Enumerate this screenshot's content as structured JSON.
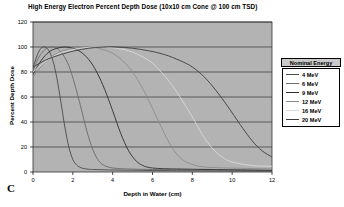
{
  "chart_data": {
    "type": "line",
    "title": "High Energy Electron Percent Depth Dose (10x10 cm Cone @ 100 cm TSD)",
    "xlabel": "Depth in Water (cm)",
    "ylabel": "Percent Depth Dose",
    "xlim": [
      0,
      12
    ],
    "ylim": [
      0,
      120
    ],
    "xticks": [
      0,
      2,
      4,
      6,
      8,
      10,
      12
    ],
    "yticks": [
      0,
      20,
      40,
      60,
      80,
      100,
      120
    ],
    "grid": "horizontal",
    "plot_background": "#b3b3b3",
    "legend_position": "right-outside",
    "legend_title": "Nominal Energy",
    "panel_letter": "C",
    "series": [
      {
        "name": "4 MeV",
        "color": "#4a4a4a",
        "x": [
          0,
          0.2,
          0.4,
          0.6,
          0.8,
          1.0,
          1.2,
          1.4,
          1.6,
          1.8,
          2.0,
          2.2,
          2.4,
          2.6,
          2.8,
          3.0,
          3.5,
          4.0,
          5.0,
          6.0,
          8.0,
          10.0,
          12.0
        ],
        "y": [
          83,
          93,
          99,
          100,
          97,
          89,
          75,
          56,
          36,
          20,
          10,
          5.5,
          3.5,
          2.6,
          2.2,
          2.0,
          1.8,
          1.6,
          1.4,
          1.2,
          1.0,
          0.8,
          0.6
        ]
      },
      {
        "name": "6 MeV",
        "color": "#6b6b6b",
        "x": [
          0,
          0.3,
          0.6,
          0.9,
          1.2,
          1.5,
          1.8,
          2.1,
          2.4,
          2.7,
          3.0,
          3.3,
          3.6,
          4.0,
          4.5,
          5.0,
          6.0,
          7.0,
          8.0,
          10.0,
          12.0
        ],
        "y": [
          81,
          92,
          98,
          100,
          99,
          94,
          85,
          70,
          52,
          33,
          18,
          9,
          5,
          3.2,
          2.6,
          2.3,
          2.0,
          1.8,
          1.6,
          1.3,
          1.0
        ]
      },
      {
        "name": "9 MeV",
        "color": "#2e2e2e",
        "x": [
          0,
          0.4,
          0.8,
          1.2,
          1.6,
          2.0,
          2.4,
          2.8,
          3.2,
          3.6,
          4.0,
          4.4,
          4.8,
          5.2,
          5.6,
          6.0,
          6.5,
          7.0,
          8.0,
          9.0,
          10.0,
          12.0
        ],
        "y": [
          78,
          89,
          96,
          99,
          100,
          99,
          96,
          90,
          80,
          66,
          49,
          31,
          17,
          8.5,
          4.6,
          3.2,
          2.7,
          2.5,
          2.2,
          2.0,
          1.8,
          1.4
        ]
      },
      {
        "name": "12 MeV",
        "color": "#8c8c8c",
        "x": [
          0,
          0.5,
          1.0,
          1.5,
          2.0,
          2.5,
          3.0,
          3.5,
          4.0,
          4.5,
          5.0,
          5.5,
          6.0,
          6.5,
          7.0,
          7.5,
          8.0,
          8.5,
          9.0,
          10.0,
          11.0,
          12.0
        ],
        "y": [
          76,
          86,
          93,
          97,
          99,
          100,
          100,
          98,
          95,
          89,
          80,
          67,
          51,
          34,
          19,
          10,
          6,
          4.2,
          3.6,
          3.1,
          2.8,
          2.5
        ]
      },
      {
        "name": "16 MeV",
        "color": "#d9d9d9",
        "x": [
          0,
          0.6,
          1.2,
          1.8,
          2.4,
          3.0,
          3.6,
          4.2,
          4.8,
          5.4,
          6.0,
          6.6,
          7.0,
          7.5,
          8.0,
          8.5,
          9.0,
          9.5,
          10.0,
          11.0,
          12.0
        ],
        "y": [
          80,
          88,
          94,
          97,
          99,
          100,
          100,
          99,
          97,
          93,
          87,
          77,
          69,
          57,
          44,
          30,
          19,
          12,
          8,
          5.2,
          4.6
        ]
      },
      {
        "name": "20 MeV",
        "color": "#3d3d3d",
        "x": [
          0,
          0.7,
          1.4,
          2.1,
          2.8,
          3.5,
          4.2,
          5.0,
          5.8,
          6.6,
          7.4,
          8.0,
          8.6,
          9.2,
          9.8,
          10.4,
          11.0,
          11.5,
          12.0
        ],
        "y": [
          84,
          90,
          94,
          97,
          99,
          100,
          100,
          99,
          97,
          94,
          89,
          84,
          76,
          65,
          52,
          38,
          25,
          17,
          12
        ]
      }
    ]
  },
  "legend": {
    "title": "Nominal Energy",
    "entries": [
      {
        "label": "4 MeV"
      },
      {
        "label": "6 MeV"
      },
      {
        "label": "9 MeV"
      },
      {
        "label": "12 MeV"
      },
      {
        "label": "16 MeV"
      },
      {
        "label": "20 MeV"
      }
    ]
  },
  "panel": {
    "letter": "C"
  }
}
